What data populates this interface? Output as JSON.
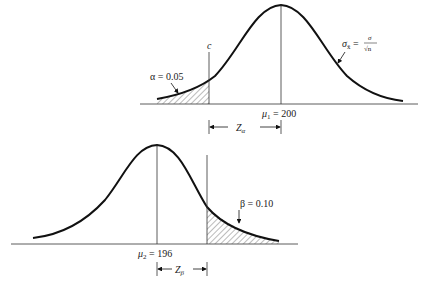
{
  "top_panel": {
    "critical_label": "c",
    "alpha_label": "α = 0.05",
    "mean_label_symbol": "μ",
    "mean_label_sub": "1",
    "mean_label_value": " = 200",
    "sigma_label_symbol": "σ",
    "sigma_label_sub": "x̄",
    "sigma_label_eq": " =",
    "sigma_frac_num": "σ",
    "sigma_frac_den": "√n",
    "z_label_main": "Z",
    "z_label_sub": "α"
  },
  "bottom_panel": {
    "beta_label": "β = 0.10",
    "mean_label_symbol": "μ",
    "mean_label_sub": "2",
    "mean_label_value": " = 196",
    "z_label_main": "Z",
    "z_label_sub": "β"
  },
  "colors": {
    "ink": "#111111",
    "hatch": "#444444",
    "background": "#ffffff"
  }
}
